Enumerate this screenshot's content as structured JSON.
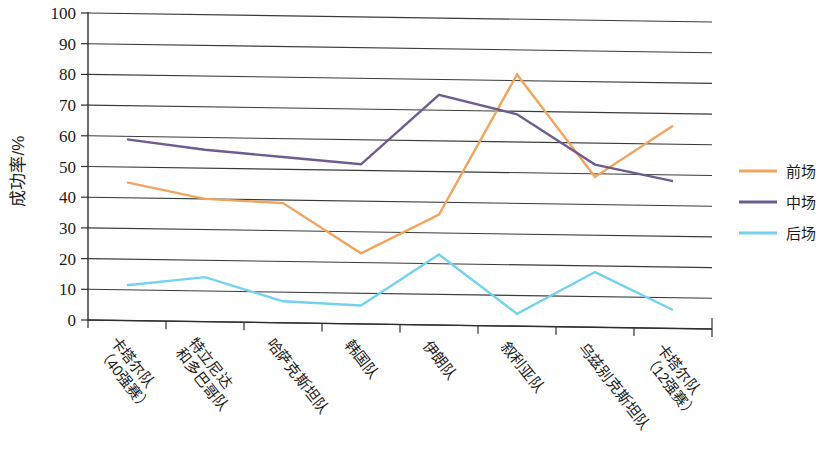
{
  "chart_data": {
    "type": "line",
    "title": "",
    "xlabel": "",
    "ylabel": "成功率/%",
    "ylim": [
      0,
      100
    ],
    "ytick_step": 10,
    "yticks": [
      0,
      10,
      20,
      30,
      40,
      50,
      60,
      70,
      80,
      90,
      100
    ],
    "grid": true,
    "legend_position": "right",
    "categories": [
      "卡塔尔队\n（40强赛）",
      "特立尼达\n和多巴哥队",
      "哈萨克斯坦队",
      "韩国队",
      "伊朗队",
      "叙利亚队",
      "乌兹别克斯坦队",
      "卡塔尔队\n（12强赛）"
    ],
    "categories_flat": [
      "卡塔尔队（40强赛）",
      "特立尼达和多巴哥队",
      "哈萨克斯坦队",
      "韩国队",
      "伊朗队",
      "叙利亚队",
      "乌兹别克斯坦队",
      "卡塔尔队（12强赛）"
    ],
    "series": [
      {
        "name": "前场",
        "color": "#EFA55E",
        "values": [
          45,
          40,
          39,
          23,
          36,
          82,
          49,
          66
        ]
      },
      {
        "name": "中场",
        "color": "#6E5C90",
        "values": [
          59,
          56,
          54,
          52,
          75,
          69,
          53,
          48
        ]
      },
      {
        "name": "后场",
        "color": "#74D2EE",
        "values": [
          11.5,
          14.5,
          7,
          6,
          23,
          4,
          18,
          6
        ]
      }
    ]
  },
  "legend": {
    "items": [
      {
        "label": "前场",
        "color": "#EFA55E"
      },
      {
        "label": "中场",
        "color": "#6E5C90"
      },
      {
        "label": "后场",
        "color": "#74D2EE"
      }
    ]
  },
  "axes": {
    "y_title": "成功率/%",
    "y_tick_labels": [
      "100",
      "90",
      "80",
      "70",
      "60",
      "50",
      "40",
      "30",
      "20",
      "10",
      "0"
    ]
  }
}
